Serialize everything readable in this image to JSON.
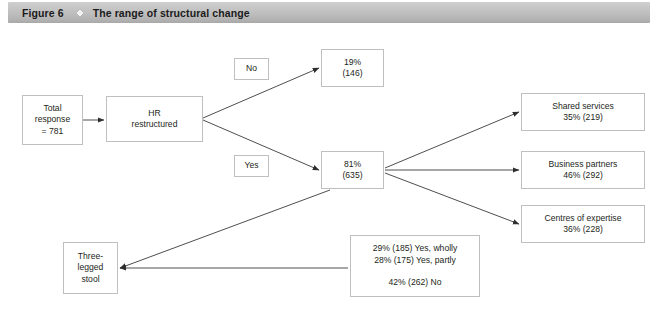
{
  "caption": {
    "number": "Figure 6",
    "separator_icon": "diamond-icon",
    "title": "The range of structural change"
  },
  "colors": {
    "caption_bar_light": "#cfcfcf",
    "caption_bar_dark": "#a8a8a8",
    "box_border": "#bfbfbf",
    "connector": "#3a3a3a",
    "text": "#231f20",
    "page_background": "#ffffff"
  },
  "diagram": {
    "type": "flowchart",
    "nodes": [
      {
        "id": "total-response",
        "label": "Total\nresponse\n= 781",
        "x": 22,
        "y": 95,
        "w": 61,
        "h": 50
      },
      {
        "id": "hr-restructured",
        "label": "HR\nrestructured",
        "x": 106,
        "y": 96,
        "w": 97,
        "h": 46
      },
      {
        "id": "label-no",
        "label": "No",
        "x": 234,
        "y": 58,
        "w": 35,
        "h": 22
      },
      {
        "id": "label-yes",
        "label": "Yes",
        "x": 234,
        "y": 155,
        "w": 35,
        "h": 22
      },
      {
        "id": "no-result",
        "label": "19%\n(146)",
        "x": 321,
        "y": 49,
        "w": 63,
        "h": 38
      },
      {
        "id": "yes-result",
        "label": "81%\n(635)",
        "x": 321,
        "y": 151,
        "w": 63,
        "h": 38
      },
      {
        "id": "shared-services",
        "label": "Shared services\n35% (219)",
        "x": 521,
        "y": 93,
        "w": 124,
        "h": 38
      },
      {
        "id": "business-partners",
        "label": "Business partners\n46% (292)",
        "x": 521,
        "y": 151,
        "w": 124,
        "h": 38
      },
      {
        "id": "centres-of-expertise",
        "label": "Centres of expertise\n36% (228)",
        "x": 521,
        "y": 205,
        "w": 124,
        "h": 38
      },
      {
        "id": "three-legged-stool",
        "label": "Three-\nlegged\nstool",
        "x": 63,
        "y": 242,
        "w": 55,
        "h": 52
      },
      {
        "id": "stool-breakdown",
        "label": "29% (185) Yes, wholly\n28% (175) Yes, partly\n\n42% (262) No",
        "x": 350,
        "y": 235,
        "w": 130,
        "h": 62
      }
    ],
    "edges": [
      {
        "id": "edge-total-to-hr",
        "from": "total-response",
        "to": "hr-restructured",
        "x1": 83,
        "y1": 120,
        "x2": 104,
        "y2": 120
      },
      {
        "id": "edge-hr-to-no-result",
        "from": "hr-restructured",
        "to": "no-result",
        "x1": 203,
        "y1": 118,
        "x2": 319,
        "y2": 68
      },
      {
        "id": "edge-hr-to-yes-result",
        "from": "hr-restructured",
        "to": "yes-result",
        "x1": 203,
        "y1": 120,
        "x2": 319,
        "y2": 170
      },
      {
        "id": "edge-yes-to-shared",
        "from": "yes-result",
        "to": "shared-services",
        "x1": 385,
        "y1": 168,
        "x2": 519,
        "y2": 112
      },
      {
        "id": "edge-yes-to-business",
        "from": "yes-result",
        "to": "business-partners",
        "x1": 385,
        "y1": 170,
        "x2": 519,
        "y2": 170
      },
      {
        "id": "edge-yes-to-centres",
        "from": "yes-result",
        "to": "centres-of-expertise",
        "x1": 385,
        "y1": 173,
        "x2": 519,
        "y2": 224
      },
      {
        "id": "edge-yes-to-stool",
        "from": "yes-result",
        "to": "three-legged-stool",
        "x1": 330,
        "y1": 190,
        "x2": 120,
        "y2": 268
      },
      {
        "id": "edge-breakdown-to-stool",
        "from": "stool-breakdown",
        "to": "three-legged-stool",
        "x1": 348,
        "y1": 268,
        "x2": 120,
        "y2": 268
      }
    ]
  }
}
